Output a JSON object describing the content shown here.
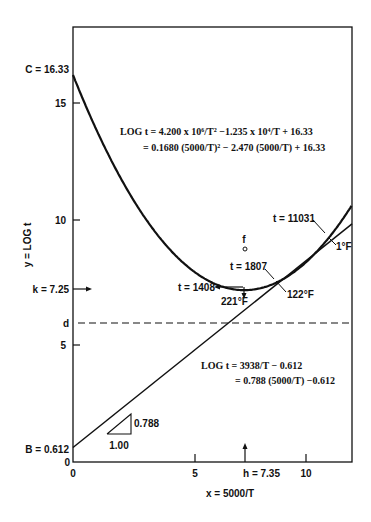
{
  "chart_data": {
    "type": "line",
    "title": "",
    "xlabel": "x = 5000/T",
    "ylabel": "y = LOG t",
    "xlim": [
      0,
      12
    ],
    "ylim": [
      0,
      18
    ],
    "grid": false,
    "x_ticks": [
      "0",
      "5",
      "10"
    ],
    "y_ticks": [
      "0",
      "5",
      "10",
      "15"
    ],
    "series": [
      {
        "name": "quadratic",
        "equation_line1": "LOG t = 4.200 x 10⁶/T² −1.235 x 10⁴/T + 16.33",
        "equation_line2": "= 0.1680 (5000/T)² − 2.470 (5000/T) + 16.33",
        "coefficients": {
          "a": 0.168,
          "b": -2.47,
          "c": 16.33
        },
        "x": [
          0,
          1,
          2,
          3,
          4,
          5,
          6,
          7,
          7.35,
          8,
          9,
          10,
          11,
          12
        ],
        "y": [
          16.33,
          14.03,
          12.06,
          10.43,
          9.14,
          8.18,
          7.56,
          7.28,
          7.25,
          7.34,
          7.7,
          8.41,
          9.46,
          10.88
        ]
      },
      {
        "name": "linear",
        "equation_line1": "LOG t = 3938/T − 0.612",
        "equation_line2": "= 0.788 (5000/T) −0.612",
        "coefficients": {
          "slope": 0.788,
          "intercept": 0.612
        },
        "x": [
          0,
          12
        ],
        "y": [
          0.612,
          10.068
        ]
      }
    ],
    "annotations": {
      "C": "C = 16.33",
      "k": "k = 7.25",
      "d": "d",
      "B": "B = 0.612",
      "h": "h = 7.35",
      "f": "f",
      "t_min": "t = 1408",
      "t_min_temp": "221°F",
      "t_mid": "t = 1807",
      "t_mid_temp": "122°F",
      "t_high": "t = 11031",
      "t_high_temp": "1°F",
      "slope_run": "1.00",
      "slope_rise": "0.788"
    },
    "d_level": 5.8
  }
}
